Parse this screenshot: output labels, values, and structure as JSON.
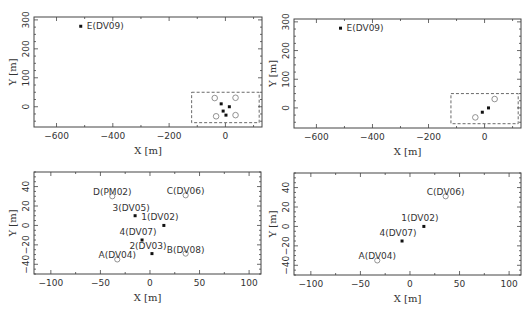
{
  "chart_data": [
    {
      "type": "scatter",
      "title": "",
      "xlabel": "X [m]",
      "ylabel": "Y [m]",
      "xlim": [
        -680,
        130
      ],
      "ylim": [
        -70,
        310
      ],
      "xticks": [
        -600,
        -400,
        -200,
        0
      ],
      "yticks": [
        0,
        100,
        200,
        300
      ],
      "grid": false,
      "inset_box": {
        "x": [
          -120,
          120
        ],
        "y": [
          -55,
          50
        ],
        "style": "dashed"
      },
      "series": [
        {
          "name": "filled",
          "marker": "filled-square",
          "points": [
            {
              "label": "E(DV09)",
              "x": -514,
              "y": 278
            },
            {
              "label": "",
              "x": 14,
              "y": 0
            },
            {
              "label": "",
              "x": -15,
              "y": 10
            },
            {
              "label": "",
              "x": -8,
              "y": -15
            },
            {
              "label": "",
              "x": 2,
              "y": -29
            }
          ]
        },
        {
          "name": "open",
          "marker": "open-circle",
          "points": [
            {
              "label": "",
              "x": -38,
              "y": 30
            },
            {
              "label": "",
              "x": 36,
              "y": 31
            },
            {
              "label": "",
              "x": -33,
              "y": -33
            },
            {
              "label": "",
              "x": 36,
              "y": -29
            }
          ]
        }
      ]
    },
    {
      "type": "scatter",
      "title": "",
      "xlabel": "X [m]",
      "ylabel": "Y [m]",
      "xlim": [
        -680,
        130
      ],
      "ylim": [
        -70,
        310
      ],
      "xticks": [
        -600,
        -400,
        -200,
        0
      ],
      "yticks": [
        0,
        100,
        200,
        300
      ],
      "grid": false,
      "inset_box": {
        "x": [
          -120,
          120
        ],
        "y": [
          -55,
          50
        ],
        "style": "dashed"
      },
      "series": [
        {
          "name": "filled",
          "marker": "filled-square",
          "points": [
            {
              "label": "E(DV09)",
              "x": -514,
              "y": 278
            },
            {
              "label": "",
              "x": 14,
              "y": 0
            },
            {
              "label": "",
              "x": -8,
              "y": -15
            }
          ]
        },
        {
          "name": "open",
          "marker": "open-circle",
          "points": [
            {
              "label": "",
              "x": 36,
              "y": 31
            },
            {
              "label": "",
              "x": -33,
              "y": -33
            }
          ]
        }
      ]
    },
    {
      "type": "scatter",
      "title": "",
      "xlabel": "X [m]",
      "ylabel": "Y [m]",
      "xlim": [
        -117,
        112
      ],
      "ylim": [
        -50,
        55
      ],
      "xticks": [
        -100,
        -50,
        0,
        50,
        100
      ],
      "yticks": [
        -40,
        -20,
        0,
        20,
        40
      ],
      "grid": false,
      "series": [
        {
          "name": "filled",
          "marker": "filled-square",
          "points": [
            {
              "label": "1(DV02)",
              "x": 14,
              "y": 0
            },
            {
              "label": "2(DV03)",
              "x": 2,
              "y": -29
            },
            {
              "label": "3(DV05)",
              "x": -15,
              "y": 10
            },
            {
              "label": "4(DV07)",
              "x": -8,
              "y": -15
            }
          ]
        },
        {
          "name": "open",
          "marker": "open-circle",
          "points": [
            {
              "label": "A(DV04)",
              "x": -33,
              "y": -35
            },
            {
              "label": "B(DV08)",
              "x": 36,
              "y": -29
            },
            {
              "label": "C(DV06)",
              "x": 36,
              "y": 31
            },
            {
              "label": "D(PM02)",
              "x": -38,
              "y": 30
            }
          ]
        }
      ]
    },
    {
      "type": "scatter",
      "title": "",
      "xlabel": "X [m]",
      "ylabel": "Y [m]",
      "xlim": [
        -117,
        112
      ],
      "ylim": [
        -50,
        55
      ],
      "xticks": [
        -100,
        -50,
        0,
        50,
        100
      ],
      "yticks": [
        -40,
        -20,
        0,
        20,
        40
      ],
      "grid": false,
      "series": [
        {
          "name": "filled",
          "marker": "filled-square",
          "points": [
            {
              "label": "1(DV02)",
              "x": 14,
              "y": 0
            },
            {
              "label": "4(DV07)",
              "x": -8,
              "y": -15
            }
          ]
        },
        {
          "name": "open",
          "marker": "open-circle",
          "points": [
            {
              "label": "A(DV04)",
              "x": -33,
              "y": -35
            },
            {
              "label": "C(DV06)",
              "x": 36,
              "y": 31
            }
          ]
        }
      ]
    }
  ],
  "layout": {
    "panels": [
      {
        "left": 34,
        "top": 17,
        "width": 228,
        "height": 110
      },
      {
        "left": 294,
        "top": 19,
        "width": 227,
        "height": 109
      },
      {
        "left": 34,
        "top": 172,
        "width": 227,
        "height": 102
      },
      {
        "left": 294,
        "top": 173,
        "width": 227,
        "height": 102
      }
    ],
    "colors": {
      "axis": "#444444",
      "marker": "#111111",
      "open": "#777777",
      "text": "#333333"
    }
  }
}
